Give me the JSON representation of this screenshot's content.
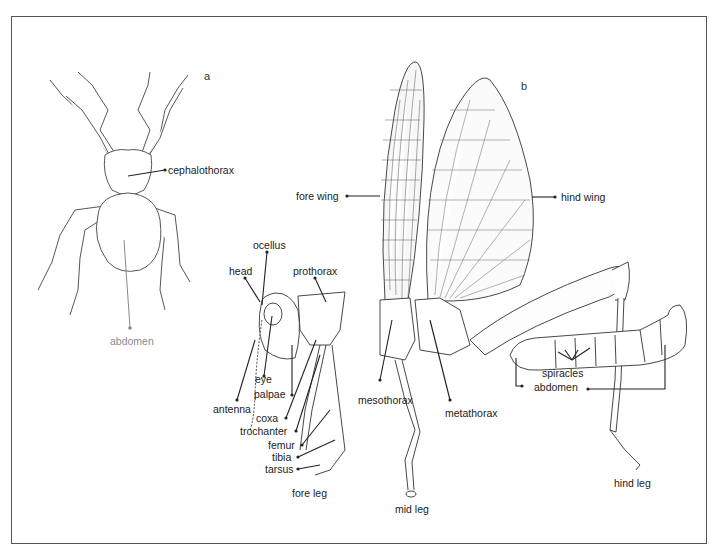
{
  "figure": {
    "panels": [
      {
        "id": "a",
        "letter": "a",
        "subject": "spider",
        "labels": {
          "cephalothorax": "cephalothorax",
          "abdomen": "abdomen"
        }
      },
      {
        "id": "b",
        "letter": "b",
        "subject": "grasshopper",
        "labels": {
          "fore_wing": "fore wing",
          "hind_wing": "hind wing",
          "ocellus": "ocellus",
          "head": "head",
          "prothorax": "prothorax",
          "eye": "eye",
          "palpae": "palpae",
          "antenna": "antenna",
          "coxa": "coxa",
          "trochanter": "trochanter",
          "femur": "femur",
          "tibia": "tibia",
          "tarsus": "tarsus",
          "fore_leg": "fore leg",
          "mesothorax": "mesothorax",
          "metathorax": "metathorax",
          "mid_leg": "mid leg",
          "spiracles": "spiracles",
          "abdomen": "abdomen",
          "hind_leg": "hind leg"
        }
      }
    ]
  },
  "colors": {
    "ink": "#222222",
    "frame": "#555555",
    "grey_label": "#8a8a8a"
  }
}
